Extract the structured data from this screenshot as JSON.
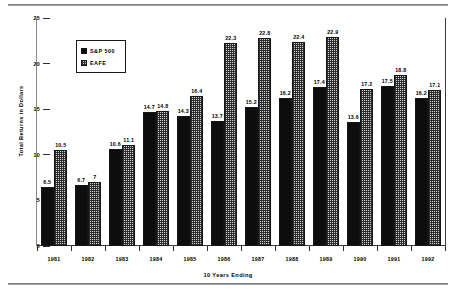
{
  "chart_data": {
    "type": "bar",
    "title": "",
    "xlabel": "10 Years Ending",
    "ylabel": "Total Returns in Dollars",
    "ylim": [
      0,
      25
    ],
    "yticks": [
      0,
      5,
      10,
      15,
      20,
      25
    ],
    "ytick_labels": [
      "0",
      "5",
      "10",
      "15",
      "20",
      "25"
    ],
    "grid": false,
    "legend_position": "upper-left-inside",
    "categories": [
      "1981",
      "1982",
      "1983",
      "1984",
      "1985",
      "1986",
      "1987",
      "1988",
      "1989",
      "1990",
      "1991",
      "1992"
    ],
    "series": [
      {
        "name": "S&P 500",
        "color": "#0d0d0d",
        "fill": "solid-black",
        "values": [
          6.5,
          6.7,
          10.6,
          14.7,
          14.3,
          13.7,
          15.2,
          16.2,
          17.4,
          13.6,
          17.5,
          16.2
        ],
        "data_labels": [
          "6.5",
          "6.7",
          "10.6",
          "14.7",
          "14.3",
          "13.7",
          "15.2",
          "16.2",
          "17.4",
          "13.6",
          "17.5",
          "16.2"
        ]
      },
      {
        "name": "EAFE",
        "color": "#d2d2d2",
        "fill": "checkered-hatch",
        "values": [
          10.5,
          7,
          11.1,
          14.8,
          16.4,
          22.3,
          22.8,
          22.4,
          22.9,
          17.2,
          18.8,
          17.1
        ],
        "data_labels": [
          "10.5",
          "7",
          "11.1",
          "14.8",
          "16.4",
          "22.3",
          "22.8",
          "22.4",
          "22.9",
          "17.2",
          "18.8",
          "17.1"
        ]
      }
    ]
  },
  "legend": {
    "items": [
      {
        "label": "S&P 500",
        "swatch": "solid-black-square"
      },
      {
        "label": "EAFE",
        "swatch": "checkered-square"
      }
    ]
  }
}
